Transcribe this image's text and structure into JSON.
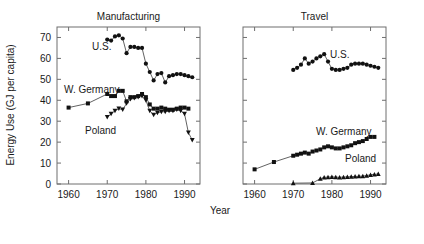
{
  "figure": {
    "xlabel": "Year",
    "ylabel": "Energy Use (GJ per capita)"
  },
  "panels": {
    "left": {
      "title": "Manufacturing",
      "labels": {
        "us": "U.S.",
        "wgermany": "W. Germany",
        "poland": "Poland"
      }
    },
    "right": {
      "title": "Travel",
      "labels": {
        "us": "U.S.",
        "wgermany": "W. Germany",
        "poland": "Poland"
      }
    }
  },
  "axes": {
    "y_ticks": [
      "0",
      "10",
      "20",
      "30",
      "40",
      "50",
      "60",
      "70"
    ],
    "x_ticks_left": [
      "1960",
      "1970",
      "1980",
      "1990"
    ],
    "x_ticks_right": [
      "1960",
      "1970",
      "1980",
      "1990"
    ]
  },
  "chart_data": [
    {
      "type": "line",
      "title": "Manufacturing",
      "xlabel": "Year",
      "ylabel": "Energy Use (GJ per capita)",
      "xlim": [
        1957,
        1994
      ],
      "ylim": [
        0,
        75
      ],
      "grid": false,
      "legend": "inline-annotations",
      "series": [
        {
          "name": "U.S.",
          "marker": "filled-circle",
          "x": [
            1970,
            1971,
            1972,
            1973,
            1974,
            1975,
            1976,
            1977,
            1978,
            1979,
            1980,
            1981,
            1982,
            1983,
            1984,
            1985,
            1986,
            1987,
            1988,
            1989,
            1990,
            1991,
            1992
          ],
          "y": [
            69.0,
            68.5,
            70.5,
            71.0,
            69.5,
            62.5,
            65.5,
            65.5,
            65.0,
            65.0,
            57.5,
            53.5,
            49.5,
            52.5,
            53.0,
            48.5,
            51.5,
            52.0,
            52.5,
            52.5,
            52.0,
            51.5,
            51.0
          ]
        },
        {
          "name": "W. Germany",
          "marker": "filled-square",
          "x": [
            1960,
            1965,
            1970,
            1971,
            1972,
            1973,
            1974,
            1975,
            1976,
            1977,
            1978,
            1979,
            1980,
            1981,
            1982,
            1983,
            1984,
            1985,
            1986,
            1987,
            1988,
            1989,
            1990,
            1991
          ],
          "y": [
            36.5,
            38.5,
            43.0,
            42.0,
            42.0,
            44.5,
            44.5,
            39.5,
            41.5,
            41.5,
            42.0,
            43.0,
            41.5,
            38.0,
            36.0,
            36.0,
            36.5,
            36.0,
            35.5,
            35.5,
            36.0,
            36.5,
            36.5,
            36.0
          ]
        },
        {
          "name": "Poland",
          "marker": "filled-triangle-down",
          "x": [
            1970,
            1971,
            1972,
            1973,
            1974,
            1975,
            1976,
            1977,
            1978,
            1979,
            1980,
            1981,
            1982,
            1983,
            1984,
            1985,
            1986,
            1987,
            1988,
            1989,
            1990,
            1991,
            1992
          ],
          "y": [
            32.0,
            33.5,
            35.0,
            36.0,
            35.5,
            38.5,
            40.5,
            41.0,
            41.5,
            42.0,
            40.0,
            35.0,
            33.0,
            34.0,
            34.5,
            34.5,
            35.0,
            35.0,
            35.5,
            35.0,
            33.5,
            24.5,
            21.0
          ]
        }
      ]
    },
    {
      "type": "line",
      "title": "Travel",
      "xlabel": "Year",
      "ylabel": "Energy Use (GJ per capita)",
      "xlim": [
        1957,
        1994
      ],
      "ylim": [
        0,
        75
      ],
      "grid": false,
      "legend": "inline-annotations",
      "series": [
        {
          "name": "U.S.",
          "marker": "filled-circle",
          "x": [
            1970,
            1971,
            1972,
            1973,
            1974,
            1975,
            1976,
            1977,
            1978,
            1979,
            1980,
            1981,
            1982,
            1983,
            1984,
            1985,
            1986,
            1987,
            1988,
            1989,
            1990,
            1991,
            1992
          ],
          "y": [
            54.5,
            55.5,
            57.0,
            60.0,
            57.5,
            58.5,
            60.0,
            61.0,
            62.0,
            58.5,
            55.0,
            54.5,
            54.5,
            55.0,
            55.5,
            57.0,
            57.5,
            57.5,
            57.5,
            57.0,
            56.5,
            56.0,
            55.5
          ]
        },
        {
          "name": "W. Germany",
          "marker": "filled-square",
          "x": [
            1960,
            1965,
            1970,
            1971,
            1972,
            1973,
            1974,
            1975,
            1976,
            1977,
            1978,
            1979,
            1980,
            1981,
            1982,
            1983,
            1984,
            1985,
            1986,
            1987,
            1988,
            1989,
            1990,
            1991
          ],
          "y": [
            7.0,
            10.5,
            13.5,
            14.0,
            14.5,
            15.0,
            14.5,
            15.5,
            16.0,
            16.5,
            17.5,
            18.0,
            17.5,
            17.0,
            17.0,
            17.5,
            18.0,
            18.5,
            19.5,
            20.0,
            20.5,
            21.5,
            22.5,
            22.5
          ]
        },
        {
          "name": "Poland",
          "marker": "filled-triangle-up",
          "x": [
            1970,
            1975,
            1977,
            1978,
            1979,
            1980,
            1981,
            1982,
            1983,
            1984,
            1985,
            1986,
            1987,
            1988,
            1989,
            1990,
            1991,
            1992
          ],
          "y": [
            0.4,
            0.5,
            2.5,
            3.2,
            3.3,
            3.4,
            3.3,
            3.2,
            3.3,
            3.4,
            3.5,
            3.6,
            3.7,
            3.8,
            4.0,
            4.4,
            4.6,
            4.8
          ]
        }
      ]
    }
  ]
}
